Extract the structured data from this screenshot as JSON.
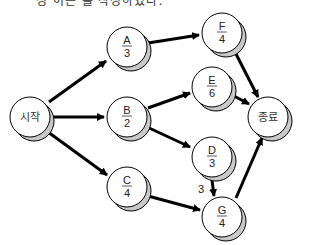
{
  "caption": "정 이는 를 작성하였다.",
  "diagram": {
    "type": "activity-on-node network",
    "colors": {
      "node_fill": "#ffffff",
      "shadow_fill": "#c8c8c8",
      "stroke": "#000000"
    },
    "nodes": [
      {
        "id": "start",
        "label": "시작"
      },
      {
        "id": "A",
        "name": "A",
        "duration": "3"
      },
      {
        "id": "B",
        "name": "B",
        "duration": "2"
      },
      {
        "id": "C",
        "name": "C",
        "duration": "4"
      },
      {
        "id": "F",
        "name": "F",
        "duration": "4"
      },
      {
        "id": "E",
        "name": "E",
        "duration": "6"
      },
      {
        "id": "D",
        "name": "D",
        "duration": "3"
      },
      {
        "id": "G",
        "name": "G",
        "duration": "4"
      },
      {
        "id": "end",
        "label": "종료"
      }
    ],
    "edges": [
      {
        "from": "start",
        "to": "A"
      },
      {
        "from": "start",
        "to": "B"
      },
      {
        "from": "start",
        "to": "C"
      },
      {
        "from": "A",
        "to": "F"
      },
      {
        "from": "B",
        "to": "E"
      },
      {
        "from": "B",
        "to": "D"
      },
      {
        "from": "C",
        "to": "G"
      },
      {
        "from": "D",
        "to": "G",
        "label": "3"
      },
      {
        "from": "F",
        "to": "end"
      },
      {
        "from": "E",
        "to": "end"
      },
      {
        "from": "G",
        "to": "end"
      }
    ]
  }
}
